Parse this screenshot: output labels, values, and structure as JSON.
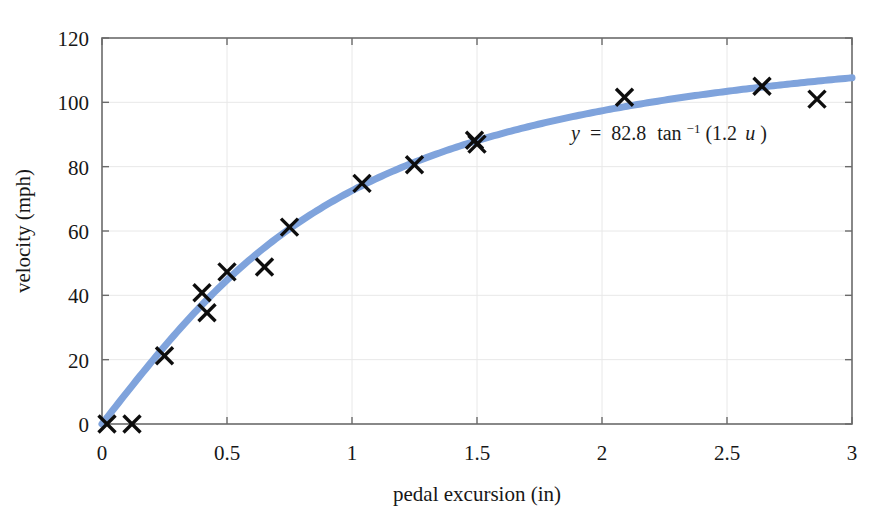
{
  "figure": {
    "background_color": "#ffffff",
    "plot_border_color": "#6b6b6b",
    "grid_color": "#e8e8e8",
    "marker_color": "#0d0d0d",
    "curve_color": "#7fa3dc"
  },
  "annotation": {
    "name": "fit-equation",
    "lhs": "y",
    "equals": "=",
    "amplitude": "82.8",
    "function": "tan",
    "exponent": "−1",
    "argument": "(1.2",
    "variable": "u",
    "close_paren": ")",
    "full_text": "y = 82.8 tan⁻¹(1.2 u)"
  },
  "chart_data": {
    "type": "scatter",
    "title": "",
    "subtitle": "",
    "xlabel": "pedal excursion (in)",
    "ylabel": "velocity (mph)",
    "xlim": [
      0,
      3
    ],
    "ylim": [
      0,
      120
    ],
    "xticks": [
      0,
      0.5,
      1,
      1.5,
      2,
      2.5,
      3
    ],
    "xticklabels": [
      "0",
      "0.5",
      "1",
      "1.5",
      "2",
      "2.5",
      "3"
    ],
    "yticks": [
      0,
      20,
      40,
      60,
      80,
      100,
      120
    ],
    "yticklabels": [
      "0",
      "20",
      "40",
      "60",
      "80",
      "100",
      "120"
    ],
    "grid": true,
    "legend": "none",
    "series": [
      {
        "name": "measured data",
        "style": "markers",
        "marker": "x",
        "color": "#0d0d0d",
        "points": [
          [
            0.02,
            0.0
          ],
          [
            0.12,
            0.0
          ],
          [
            0.25,
            21.2
          ],
          [
            0.4,
            40.8
          ],
          [
            0.42,
            34.6
          ],
          [
            0.5,
            47.3
          ],
          [
            0.65,
            48.8
          ],
          [
            0.75,
            61.2
          ],
          [
            1.04,
            74.8
          ],
          [
            1.25,
            80.6
          ],
          [
            1.49,
            88.2
          ],
          [
            1.5,
            87.0
          ],
          [
            2.09,
            101.6
          ],
          [
            2.64,
            105.0
          ],
          [
            2.86,
            101.0
          ]
        ]
      },
      {
        "name": "fitted curve y = 82.8 atan(1.2 u)",
        "style": "line",
        "color": "#7fa3dc",
        "equation": "y = 82.8 * atan(1.2 * x) in degrees-free radians",
        "amplitude": 82.8,
        "rate": 1.2
      }
    ]
  }
}
